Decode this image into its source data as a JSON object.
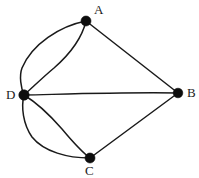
{
  "figure": {
    "kind": "undirected-multigraph",
    "width": 199,
    "height": 178,
    "background_color": "#ffffff",
    "stroke_color": "#1a1a1a",
    "vertex_color": "#0d0d0d"
  },
  "vertices": [
    {
      "id": "A",
      "label": "A",
      "x": 86,
      "y": 21,
      "r": 5.0,
      "label_x": 94,
      "label_y": 3,
      "degree": 3
    },
    {
      "id": "B",
      "label": "B",
      "x": 178,
      "y": 93,
      "r": 4.8,
      "label_x": 187,
      "label_y": 86,
      "degree": 3
    },
    {
      "id": "C",
      "label": "C",
      "x": 90,
      "y": 158,
      "r": 5.0,
      "label_x": 85,
      "label_y": 164,
      "degree": 3
    },
    {
      "id": "D",
      "label": "D",
      "x": 24,
      "y": 95,
      "r": 5.2,
      "label_x": 6,
      "label_y": 88,
      "degree": 5
    }
  ],
  "edges": [
    {
      "id": "AD-outer",
      "from": "A",
      "to": "D",
      "style": "curved",
      "bulge": "left-outer",
      "path": "M 86 21 C 60 26 32 44 22 68 C 19 76 21 88 24 95"
    },
    {
      "id": "AD-inner",
      "from": "A",
      "to": "D",
      "style": "curved",
      "bulge": "right-inner",
      "path": "M 86 21 C 82 38 70 54 54 68 C 42 78 31 89 24 95"
    },
    {
      "id": "AB",
      "from": "A",
      "to": "B",
      "style": "straight",
      "path": "M 86 21 L 178 93"
    },
    {
      "id": "DB",
      "from": "D",
      "to": "B",
      "style": "near-straight",
      "path": "M 24 95 C 70 94 130 92 178 93"
    },
    {
      "id": "DC-inner",
      "from": "D",
      "to": "C",
      "style": "curved",
      "bulge": "right-inner",
      "path": "M 24 95 C 34 101 48 113 62 129 C 72 141 82 152 90 158"
    },
    {
      "id": "DC-outer",
      "from": "D",
      "to": "C",
      "style": "curved",
      "bulge": "left-outer",
      "path": "M 24 95 C 21 107 23 124 32 137 C 44 152 68 158 90 158"
    },
    {
      "id": "CB",
      "from": "C",
      "to": "B",
      "style": "straight",
      "path": "M 90 158 L 178 93"
    }
  ]
}
